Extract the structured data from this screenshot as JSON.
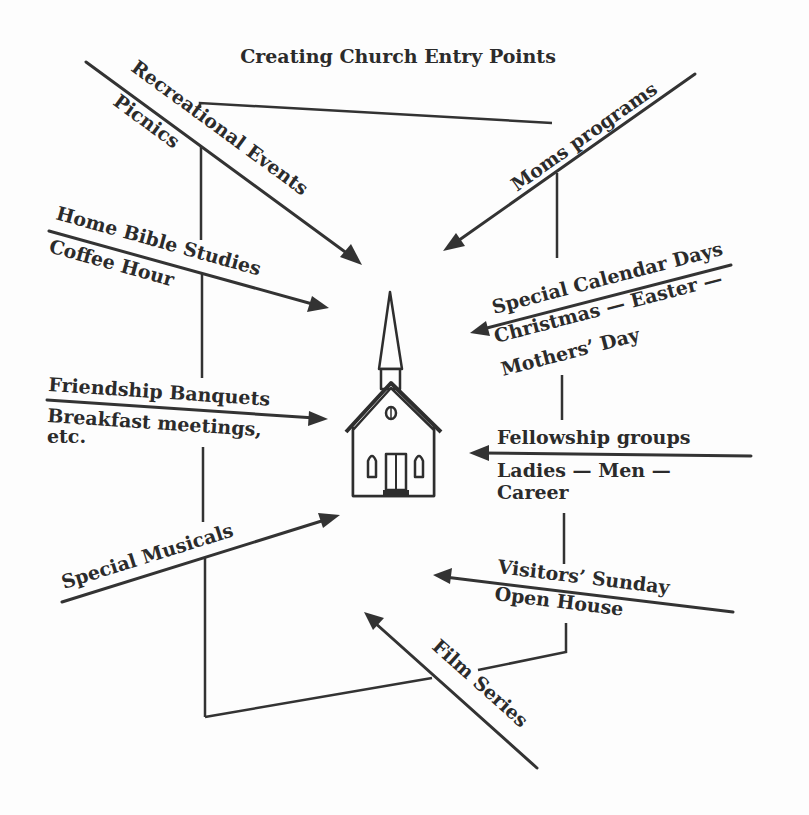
{
  "title": "Creating Church Entry Points",
  "center": {
    "icon": "church-icon",
    "label": ""
  },
  "entry_points": [
    {
      "id": "recreational-events",
      "label": "Recreational Events",
      "sublabels": [
        "Picnics"
      ],
      "side": "left",
      "direction": "into-church"
    },
    {
      "id": "home-bible-studies",
      "label": "Home Bible Studies",
      "sublabels": [
        "Coffee Hour"
      ],
      "side": "left",
      "direction": "into-church"
    },
    {
      "id": "friendship-banquets",
      "label": "Friendship Banquets",
      "sublabels": [
        "Breakfast meetings,",
        "etc."
      ],
      "side": "left",
      "direction": "into-church"
    },
    {
      "id": "special-musicals",
      "label": "Special Musicals",
      "sublabels": [],
      "side": "left",
      "direction": "into-church"
    },
    {
      "id": "moms-programs",
      "label": "Moms programs",
      "sublabels": [],
      "side": "right",
      "direction": "into-church"
    },
    {
      "id": "special-calendar-days",
      "label": "Special Calendar Days",
      "sublabels": [
        "Christmas — Easter —",
        "Mothers’ Day"
      ],
      "side": "right",
      "direction": "into-church"
    },
    {
      "id": "fellowship-groups",
      "label": "Fellowship groups",
      "sublabels": [
        "Ladies — Men —",
        "Career"
      ],
      "side": "right",
      "direction": "into-church"
    },
    {
      "id": "visitors-sunday",
      "label": "Visitors’ Sunday",
      "sublabels": [
        "Open House"
      ],
      "side": "right",
      "direction": "into-church"
    },
    {
      "id": "film-series",
      "label": "Film Series",
      "sublabels": [],
      "side": "bottom",
      "direction": "into-church"
    }
  ],
  "connectors": [
    {
      "name": "left-spine",
      "description": "vertical line linking left-side entry points"
    },
    {
      "name": "right-spine",
      "description": "vertical line linking right-side entry points"
    },
    {
      "name": "top-link",
      "description": "line joining left spine to right spine at top"
    },
    {
      "name": "bottom-link",
      "description": "line joining left spine to right spine at bottom through Film Series"
    }
  ]
}
